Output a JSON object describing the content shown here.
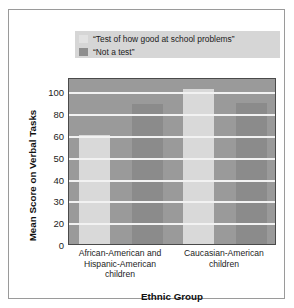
{
  "chart_data": {
    "type": "bar",
    "title": "",
    "xlabel": "Ethnic Group",
    "ylabel": "Mean Score on Verbal Tasks",
    "categories": [
      "African-American and Hispanic-American children",
      "Caucasian-American children"
    ],
    "category_lines": [
      [
        "African-American and",
        "Hispanic-American",
        "children"
      ],
      [
        "Caucasian-American",
        "children"
      ]
    ],
    "series": [
      {
        "name": "“Test of how good at school problems”",
        "values": [
          60,
          102
        ],
        "color": "#d9d9d9"
      },
      {
        "name": "“Not a test”",
        "values": [
          88,
          89
        ],
        "color": "#8b8b8b"
      }
    ],
    "yticks": [
      0,
      20,
      30,
      40,
      50,
      60,
      80,
      100
    ],
    "ytick_labels": [
      "0",
      "20",
      "30",
      "40",
      "50",
      "60",
      "80",
      "100"
    ],
    "ylim": [
      0,
      110
    ],
    "grid": true,
    "grid_color": "#f2f2f2",
    "plot_background": "#9a9a9a",
    "legend_position": "above-plot"
  },
  "legend": {
    "items": [
      {
        "label": "“Test of how good at school problems”",
        "swatch": "light"
      },
      {
        "label": "“Not a test”",
        "swatch": "dark"
      }
    ],
    "background": "#d6d6d6"
  },
  "axes": {
    "y_title": "Mean Score on Verbal Tasks",
    "x_title": "Ethnic Group",
    "ytick_labels": [
      "100",
      "80",
      "60",
      "50",
      "40",
      "30",
      "20",
      "0"
    ]
  },
  "colors": {
    "light_bar": "#d9d9d9",
    "dark_bar": "#8b8b8b",
    "plot_bg": "#9a9a9a",
    "gridline": "#f2f2f2",
    "frame": "#9a9a9a",
    "text": "#1c1c1c"
  }
}
